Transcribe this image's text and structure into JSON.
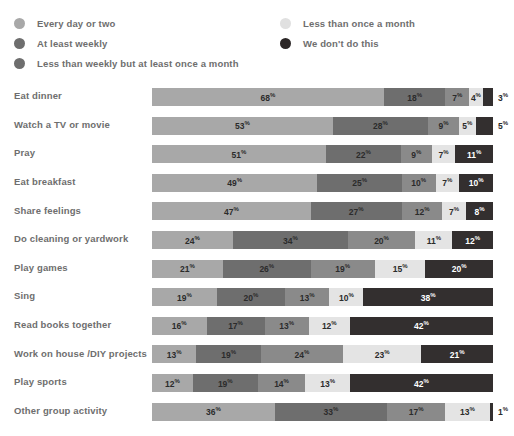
{
  "chart_data": {
    "type": "bar",
    "subtype": "stacked-horizontal-100percent",
    "title": "",
    "subtitle": "",
    "xlabel": "",
    "ylabel": "",
    "xlim": [
      0,
      100
    ],
    "grid": false,
    "legend_position": "top",
    "value_suffix": "%",
    "categories": [
      "Eat dinner",
      "Watch a TV or movie",
      "Pray",
      "Eat breakfast",
      "Share feelings",
      "Do cleaning or yardwork",
      "Play games",
      "Sing",
      "Read books together",
      "Work on house / DIY projects",
      "Play sports",
      "Other group activity"
    ],
    "series": [
      {
        "name": "Every day or two",
        "color": "#a8a8a8",
        "values": [
          68,
          53,
          51,
          49,
          47,
          24,
          21,
          19,
          16,
          13,
          12,
          36
        ]
      },
      {
        "name": "At least weekly",
        "color": "#6e6e6e",
        "values": [
          18,
          28,
          22,
          25,
          27,
          34,
          26,
          20,
          17,
          19,
          19,
          33
        ]
      },
      {
        "name": "Less than weekly but at least once a month",
        "color": "#8a8a8a",
        "values": [
          7,
          9,
          9,
          10,
          12,
          20,
          19,
          13,
          13,
          24,
          14,
          17
        ]
      },
      {
        "name": "Less than once a month",
        "color": "#e4e4e4",
        "values": [
          4,
          5,
          7,
          7,
          7,
          11,
          15,
          10,
          12,
          23,
          13,
          13
        ]
      },
      {
        "name": "We don't do this",
        "color": "#332f2f",
        "values": [
          3,
          5,
          11,
          10,
          8,
          12,
          20,
          38,
          42,
          21,
          42,
          1
        ]
      }
    ]
  },
  "legend": {
    "left_items": [
      {
        "label": "Every day or two",
        "color": "#a8a8a8"
      },
      {
        "label": "At least weekly",
        "color": "#6e6e6e"
      },
      {
        "label": "Less than weekly but at least once a month",
        "color": "#6e6e6e"
      }
    ],
    "right_items": [
      {
        "label": "Less than once a month",
        "color": "#e0e0e0"
      },
      {
        "label": "We don't do this",
        "color": "#2b2626"
      }
    ]
  },
  "rows": [
    {
      "label": "Eat dinner",
      "two_line": false,
      "segments": [
        {
          "value": "68",
          "suffix": "%",
          "color": "#a8a8a8",
          "text": "dark",
          "outside": false
        },
        {
          "value": "18",
          "suffix": "%",
          "color": "#6e6e6e",
          "text": "dark",
          "outside": false
        },
        {
          "value": "7",
          "suffix": "%",
          "color": "#8a8a8a",
          "text": "dark",
          "outside": false
        },
        {
          "value": "4",
          "suffix": "%",
          "color": "#e4e4e4",
          "text": "dark",
          "outside": false
        },
        {
          "value": "3",
          "suffix": "%",
          "color": "#332f2f",
          "text": "dark",
          "outside": true
        }
      ]
    },
    {
      "label": "Watch a TV or movie",
      "two_line": false,
      "segments": [
        {
          "value": "53",
          "suffix": "%",
          "color": "#a8a8a8",
          "text": "dark",
          "outside": false
        },
        {
          "value": "28",
          "suffix": "%",
          "color": "#6e6e6e",
          "text": "dark",
          "outside": false
        },
        {
          "value": "9",
          "suffix": "%",
          "color": "#8a8a8a",
          "text": "dark",
          "outside": false
        },
        {
          "value": "5",
          "suffix": "%",
          "color": "#e4e4e4",
          "text": "dark",
          "outside": false
        },
        {
          "value": "5",
          "suffix": "%",
          "color": "#332f2f",
          "text": "dark",
          "outside": true
        }
      ]
    },
    {
      "label": "Pray",
      "two_line": false,
      "segments": [
        {
          "value": "51",
          "suffix": "%",
          "color": "#a8a8a8",
          "text": "dark",
          "outside": false
        },
        {
          "value": "22",
          "suffix": "%",
          "color": "#6e6e6e",
          "text": "dark",
          "outside": false
        },
        {
          "value": "9",
          "suffix": "%",
          "color": "#8a8a8a",
          "text": "dark",
          "outside": false
        },
        {
          "value": "7",
          "suffix": "%",
          "color": "#e4e4e4",
          "text": "dark",
          "outside": false
        },
        {
          "value": "11",
          "suffix": "%",
          "color": "#332f2f",
          "text": "light",
          "outside": false
        }
      ]
    },
    {
      "label": "Eat breakfast",
      "two_line": false,
      "segments": [
        {
          "value": "49",
          "suffix": "%",
          "color": "#a8a8a8",
          "text": "dark",
          "outside": false
        },
        {
          "value": "25",
          "suffix": "%",
          "color": "#6e6e6e",
          "text": "dark",
          "outside": false
        },
        {
          "value": "10",
          "suffix": "%",
          "color": "#8a8a8a",
          "text": "dark",
          "outside": false
        },
        {
          "value": "7",
          "suffix": "%",
          "color": "#e4e4e4",
          "text": "dark",
          "outside": false
        },
        {
          "value": "10",
          "suffix": "%",
          "color": "#332f2f",
          "text": "light",
          "outside": false
        }
      ]
    },
    {
      "label": "Share feelings",
      "two_line": false,
      "segments": [
        {
          "value": "47",
          "suffix": "%",
          "color": "#a8a8a8",
          "text": "dark",
          "outside": false
        },
        {
          "value": "27",
          "suffix": "%",
          "color": "#6e6e6e",
          "text": "dark",
          "outside": false
        },
        {
          "value": "12",
          "suffix": "%",
          "color": "#8a8a8a",
          "text": "dark",
          "outside": false
        },
        {
          "value": "7",
          "suffix": "%",
          "color": "#e4e4e4",
          "text": "dark",
          "outside": false
        },
        {
          "value": "8",
          "suffix": "%",
          "color": "#332f2f",
          "text": "light",
          "outside": false
        }
      ]
    },
    {
      "label": "Do cleaning or yardwork",
      "two_line": false,
      "segments": [
        {
          "value": "24",
          "suffix": "%",
          "color": "#a8a8a8",
          "text": "dark",
          "outside": false
        },
        {
          "value": "34",
          "suffix": "%",
          "color": "#6e6e6e",
          "text": "dark",
          "outside": false
        },
        {
          "value": "20",
          "suffix": "%",
          "color": "#8a8a8a",
          "text": "dark",
          "outside": false
        },
        {
          "value": "11",
          "suffix": "%",
          "color": "#e4e4e4",
          "text": "dark",
          "outside": false
        },
        {
          "value": "12",
          "suffix": "%",
          "color": "#332f2f",
          "text": "light",
          "outside": false
        }
      ]
    },
    {
      "label": "Play games",
      "two_line": false,
      "segments": [
        {
          "value": "21",
          "suffix": "%",
          "color": "#a8a8a8",
          "text": "dark",
          "outside": false
        },
        {
          "value": "26",
          "suffix": "%",
          "color": "#6e6e6e",
          "text": "dark",
          "outside": false
        },
        {
          "value": "19",
          "suffix": "%",
          "color": "#8a8a8a",
          "text": "dark",
          "outside": false
        },
        {
          "value": "15",
          "suffix": "%",
          "color": "#e4e4e4",
          "text": "dark",
          "outside": false
        },
        {
          "value": "20",
          "suffix": "%",
          "color": "#332f2f",
          "text": "light",
          "outside": false
        }
      ]
    },
    {
      "label": "Sing",
      "two_line": false,
      "segments": [
        {
          "value": "19",
          "suffix": "%",
          "color": "#a8a8a8",
          "text": "dark",
          "outside": false
        },
        {
          "value": "20",
          "suffix": "%",
          "color": "#6e6e6e",
          "text": "dark",
          "outside": false
        },
        {
          "value": "13",
          "suffix": "%",
          "color": "#8a8a8a",
          "text": "dark",
          "outside": false
        },
        {
          "value": "10",
          "suffix": "%",
          "color": "#e4e4e4",
          "text": "dark",
          "outside": false
        },
        {
          "value": "38",
          "suffix": "%",
          "color": "#332f2f",
          "text": "light",
          "outside": false
        }
      ]
    },
    {
      "label": "Read books together",
      "two_line": false,
      "segments": [
        {
          "value": "16",
          "suffix": "%",
          "color": "#a8a8a8",
          "text": "dark",
          "outside": false
        },
        {
          "value": "17",
          "suffix": "%",
          "color": "#6e6e6e",
          "text": "dark",
          "outside": false
        },
        {
          "value": "13",
          "suffix": "%",
          "color": "#8a8a8a",
          "text": "dark",
          "outside": false
        },
        {
          "value": "12",
          "suffix": "%",
          "color": "#e4e4e4",
          "text": "dark",
          "outside": false
        },
        {
          "value": "42",
          "suffix": "%",
          "color": "#332f2f",
          "text": "light",
          "outside": false
        }
      ]
    },
    {
      "label": "Work on house /\nDIY projects",
      "two_line": true,
      "segments": [
        {
          "value": "13",
          "suffix": "%",
          "color": "#a8a8a8",
          "text": "dark",
          "outside": false
        },
        {
          "value": "19",
          "suffix": "%",
          "color": "#6e6e6e",
          "text": "dark",
          "outside": false
        },
        {
          "value": "24",
          "suffix": "%",
          "color": "#8a8a8a",
          "text": "dark",
          "outside": false
        },
        {
          "value": "23",
          "suffix": "%",
          "color": "#e4e4e4",
          "text": "dark",
          "outside": false
        },
        {
          "value": "21",
          "suffix": "%",
          "color": "#332f2f",
          "text": "light",
          "outside": false
        }
      ]
    },
    {
      "label": "Play sports",
      "two_line": false,
      "segments": [
        {
          "value": "12",
          "suffix": "%",
          "color": "#a8a8a8",
          "text": "dark",
          "outside": false
        },
        {
          "value": "19",
          "suffix": "%",
          "color": "#6e6e6e",
          "text": "dark",
          "outside": false
        },
        {
          "value": "14",
          "suffix": "%",
          "color": "#8a8a8a",
          "text": "dark",
          "outside": false
        },
        {
          "value": "13",
          "suffix": "%",
          "color": "#e4e4e4",
          "text": "dark",
          "outside": false
        },
        {
          "value": "42",
          "suffix": "%",
          "color": "#332f2f",
          "text": "light",
          "outside": false
        }
      ]
    },
    {
      "label": "Other group activity",
      "two_line": false,
      "segments": [
        {
          "value": "36",
          "suffix": "%",
          "color": "#a8a8a8",
          "text": "dark",
          "outside": false
        },
        {
          "value": "33",
          "suffix": "%",
          "color": "#6e6e6e",
          "text": "dark",
          "outside": false
        },
        {
          "value": "17",
          "suffix": "%",
          "color": "#8a8a8a",
          "text": "dark",
          "outside": false
        },
        {
          "value": "13",
          "suffix": "%",
          "color": "#e4e4e4",
          "text": "dark",
          "outside": false
        },
        {
          "value": "1",
          "suffix": "%",
          "color": "#332f2f",
          "text": "dark",
          "outside": true
        }
      ]
    }
  ]
}
